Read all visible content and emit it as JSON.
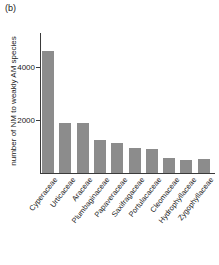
{
  "panel": {
    "label": "(b)"
  },
  "chart_data": {
    "type": "bar",
    "title": "",
    "subtitle": "",
    "xlabel": "",
    "ylabel": "number of NM to weakly AM species",
    "categories": [
      "Cyperaceae",
      "Urticaceae",
      "Araceae",
      "Plumbaginaceae",
      "Papaveraceae",
      "Saxifragaceae",
      "Portulacaceae",
      "Cleomaceae",
      "Hydrophyllaceae",
      "Zygophyllaceae"
    ],
    "values": [
      4600,
      1880,
      1870,
      1250,
      1140,
      950,
      890,
      580,
      500,
      520
    ],
    "ylim": [
      0,
      5000
    ],
    "yticks": [
      2000,
      4000
    ],
    "ytick_labels": [
      "2000",
      "4000"
    ],
    "grid": false,
    "legend": null,
    "bar_color": "#8c8c8c",
    "axis_color": "#3a3a3a"
  }
}
